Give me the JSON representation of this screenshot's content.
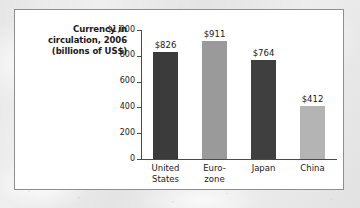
{
  "figure": {
    "title_lines": "Currency in\ncirculation, 2006\n(billions of US$)",
    "panel_background": "#ffffff",
    "panel_border_color": "#8e8e8e",
    "page_background": "#e9e9e9"
  },
  "chart_data": {
    "type": "bar",
    "title": "Currency in circulation, 2006 (billions of US$)",
    "xlabel": "",
    "ylabel": "",
    "ylim": [
      0,
      1000
    ],
    "grid": false,
    "legend": "none",
    "categories": [
      "United\nStates",
      "Euro-\nzone",
      "Japan",
      "China"
    ],
    "values": [
      826,
      911,
      764,
      412
    ],
    "data_labels": [
      "$826",
      "$911",
      "$764",
      "$412"
    ],
    "bar_colors": [
      "#3b3b3b",
      "#9a9a9a",
      "#3f3f3f",
      "#b4b4b4"
    ],
    "y_ticks": [
      0,
      200,
      400,
      600,
      800,
      1000
    ],
    "y_tick_labels": [
      "0",
      "200",
      "400",
      "600",
      "800",
      "$1,000"
    ],
    "axis_color": "#4a4a4a"
  }
}
